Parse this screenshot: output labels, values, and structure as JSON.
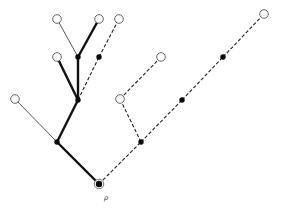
{
  "diagram": {
    "type": "rooted-tree",
    "root_label": "ρ",
    "colors": {
      "line": "#111111",
      "filled_node": "#0a0a0a",
      "open_node_stroke": "#555555",
      "background": "#ffffff"
    },
    "nodes": [
      {
        "id": "root",
        "x": 99,
        "y": 184,
        "kind": "root"
      },
      {
        "id": "A",
        "x": 57,
        "y": 142,
        "kind": "filled"
      },
      {
        "id": "B",
        "x": 141,
        "y": 142,
        "kind": "filled"
      },
      {
        "id": "C",
        "x": 15,
        "y": 99,
        "kind": "open"
      },
      {
        "id": "D",
        "x": 78,
        "y": 100,
        "kind": "filled"
      },
      {
        "id": "E",
        "x": 57,
        "y": 57,
        "kind": "open"
      },
      {
        "id": "F",
        "x": 78,
        "y": 57,
        "kind": "filled"
      },
      {
        "id": "G",
        "x": 99,
        "y": 57,
        "kind": "filled"
      },
      {
        "id": "H",
        "x": 57,
        "y": 19,
        "kind": "open"
      },
      {
        "id": "I",
        "x": 99,
        "y": 19,
        "kind": "open"
      },
      {
        "id": "J",
        "x": 119,
        "y": 19,
        "kind": "open"
      },
      {
        "id": "K",
        "x": 120,
        "y": 99,
        "kind": "open"
      },
      {
        "id": "L",
        "x": 161,
        "y": 57,
        "kind": "open"
      },
      {
        "id": "M",
        "x": 182,
        "y": 100,
        "kind": "filled"
      },
      {
        "id": "N",
        "x": 223,
        "y": 57,
        "kind": "filled"
      },
      {
        "id": "O",
        "x": 264,
        "y": 14,
        "kind": "open"
      }
    ],
    "edges": [
      {
        "from": "root",
        "to": "A",
        "style": "thick"
      },
      {
        "from": "root",
        "to": "B",
        "style": "dashed"
      },
      {
        "from": "A",
        "to": "C",
        "style": "thin"
      },
      {
        "from": "A",
        "to": "D",
        "style": "thick"
      },
      {
        "from": "D",
        "to": "E",
        "style": "thick"
      },
      {
        "from": "D",
        "to": "F",
        "style": "thick"
      },
      {
        "from": "D",
        "to": "G",
        "style": "dashed"
      },
      {
        "from": "F",
        "to": "H",
        "style": "thin"
      },
      {
        "from": "F",
        "to": "I",
        "style": "thick"
      },
      {
        "from": "G",
        "to": "J",
        "style": "dashed"
      },
      {
        "from": "B",
        "to": "K",
        "style": "dashed"
      },
      {
        "from": "K",
        "to": "L",
        "style": "dashed"
      },
      {
        "from": "B",
        "to": "M",
        "style": "dashed"
      },
      {
        "from": "M",
        "to": "N",
        "style": "dashed"
      },
      {
        "from": "N",
        "to": "O",
        "style": "dashed"
      }
    ]
  }
}
